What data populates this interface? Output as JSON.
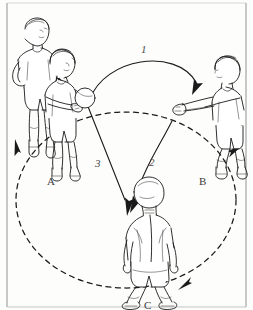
{
  "figure": {
    "background_color": "#fdfdfc",
    "ink_color": "#1a1a1a",
    "border_color": "#9a9a9a"
  },
  "positions": [
    {
      "id": "A",
      "label": "A",
      "label_x": 47,
      "label_y": 176,
      "description": "passer with ball, second player waiting behind"
    },
    {
      "id": "B",
      "label": "B",
      "label_x": 199,
      "label_y": 176,
      "description": "receiver crouched with arms extended forward"
    },
    {
      "id": "C",
      "label": "C",
      "label_x": 144,
      "label_y": 300,
      "description": "player seen from behind in ready crouch"
    }
  ],
  "steps": [
    {
      "number": "1",
      "label_x": 141,
      "label_y": 44,
      "from": "A",
      "to": "B",
      "path_style": "solid-arc",
      "description": "ball thrown in a high arc from A to B"
    },
    {
      "number": "2",
      "label_x": 149,
      "label_y": 157,
      "from": "B",
      "to": "C",
      "path_style": "solid-arc",
      "description": "ball passed from B down to C"
    },
    {
      "number": "3",
      "label_x": 95,
      "label_y": 158,
      "from": "A",
      "to": "C",
      "path_style": "solid-line",
      "description": "straight path from A down to C"
    }
  ],
  "rotation": {
    "style": "dashed-circle",
    "description": "players rotate around the dashed circle",
    "arrow_targets": [
      "A",
      "B",
      "C"
    ]
  },
  "icons": {
    "ball": "ball-icon",
    "arrowhead": "arrowhead-icon"
  }
}
